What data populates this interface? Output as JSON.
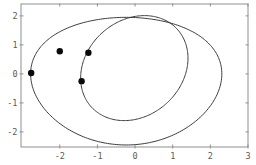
{
  "figure": {
    "background": "#ffffff",
    "frame_color": "#8f8f8f",
    "tick_color": "#8f8f8f",
    "curve_color": "#3c3c3c",
    "point_color": "#0a0a0a",
    "label_color": "#5a5a5a"
  },
  "chart_data": {
    "type": "line",
    "subtype": "phase-portrait: two closed orbits with marked points",
    "title": "",
    "xlabel": "",
    "ylabel": "",
    "grid": false,
    "legend": false,
    "xlim": [
      -3.03,
      3.0
    ],
    "ylim": [
      -2.52,
      2.41
    ],
    "x_ticks": [
      -2,
      -1,
      0,
      1,
      2,
      3
    ],
    "y_ticks": [
      -2,
      -1,
      0,
      1,
      2
    ],
    "x_tick_labels": [
      "-2",
      "-1",
      "0",
      "1",
      "2",
      "3"
    ],
    "y_tick_labels": [
      "-2",
      "-1",
      "0",
      "1",
      "2"
    ],
    "series": [
      {
        "name": "outer-orbit",
        "kind": "closed-curve",
        "shape": "egg",
        "params": {
          "cx": -0.235,
          "a": 2.54,
          "cy": 0.0,
          "b": 2.2,
          "droop": -0.25
        },
        "extremes": {
          "left": [
            -2.77,
            0.0
          ],
          "right": [
            2.3,
            0.0
          ],
          "top": [
            -0.23,
            1.95
          ],
          "bottom": [
            -0.23,
            -2.45
          ]
        }
      },
      {
        "name": "inner-orbit",
        "kind": "closed-curve",
        "shape": "sheared-ellipse",
        "params": {
          "cx": -0.02,
          "rx": 1.4,
          "cy": 0.2,
          "ry": 1.81,
          "shear": 0.27,
          "droop": 0.0
        },
        "extremes": {
          "left": [
            -1.42,
            0.2
          ],
          "right": [
            1.38,
            0.2
          ],
          "top": [
            0.25,
            2.01
          ],
          "bottom": [
            -0.29,
            -1.61
          ]
        }
      },
      {
        "name": "marked-points",
        "kind": "scatter",
        "marker": "filled-circle",
        "marker_radius_px": 3.2,
        "points": [
          [
            -2.76,
            0.03
          ],
          [
            -2.0,
            0.78
          ],
          [
            -1.24,
            0.73
          ],
          [
            -1.42,
            -0.25
          ]
        ]
      }
    ]
  }
}
